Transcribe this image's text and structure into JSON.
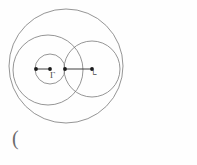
{
  "figure": {
    "name": "tangent-circles-diagram",
    "background_color": "#fefefe",
    "stroke_color": "#7a7a7a",
    "dot_color": "#1a1a1a",
    "line_color": "#2a2a2a"
  },
  "labels": {
    "left_center_label": "Г",
    "right_center_label": "└",
    "stray_paren": "("
  },
  "chart_data": {
    "type": "scatter",
    "title": "",
    "xlabel": "",
    "ylabel": "",
    "grid": false,
    "legend": "none",
    "xlim": [
      0,
      197
    ],
    "ylim": [
      0,
      165
    ],
    "shapes": [
      {
        "name": "outer-circle",
        "kind": "circle",
        "cx": 66,
        "cy": 66,
        "r": 57,
        "fill": "none"
      },
      {
        "name": "left-large-circle",
        "kind": "circle",
        "cx": 48,
        "cy": 70,
        "r": 35,
        "fill": "none"
      },
      {
        "name": "right-circle",
        "kind": "circle",
        "cx": 92,
        "cy": 69,
        "r": 28,
        "fill": "none"
      },
      {
        "name": "small-inner-circle",
        "kind": "circle",
        "cx": 50,
        "cy": 69,
        "r": 15,
        "fill": "none"
      },
      {
        "name": "radius-segment",
        "kind": "line",
        "x1": 65,
        "y1": 69,
        "x2": 92,
        "y2": 69
      },
      {
        "name": "short-segment",
        "kind": "line",
        "x1": 36,
        "y1": 69,
        "x2": 50,
        "y2": 69
      }
    ],
    "points": [
      {
        "name": "left-outer-point",
        "x": 36,
        "y": 69,
        "label": ""
      },
      {
        "name": "left-center-point",
        "x": 50,
        "y": 69,
        "label": "Г"
      },
      {
        "name": "tangency-point",
        "x": 65,
        "y": 69,
        "label": ""
      },
      {
        "name": "right-center-point",
        "x": 92,
        "y": 69,
        "label": "└"
      }
    ]
  }
}
